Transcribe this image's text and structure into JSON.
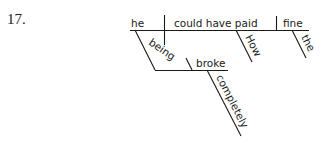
{
  "problem_number": "17.",
  "diagram": {
    "type": "sentence-diagram",
    "subject": "he",
    "verb": "could have paid",
    "direct_object": "fine",
    "modifiers": {
      "verb": [
        "How"
      ],
      "direct_object": [
        "the"
      ]
    },
    "participial_phrase": {
      "participle": "being",
      "complement": "broke",
      "complement_modifier": "completely",
      "modifies": "he"
    }
  },
  "words": {
    "he": "he",
    "verb": "could have paid",
    "object": "fine",
    "how": "How",
    "the": "the",
    "being": "being",
    "broke": "broke",
    "completely": "completely"
  }
}
